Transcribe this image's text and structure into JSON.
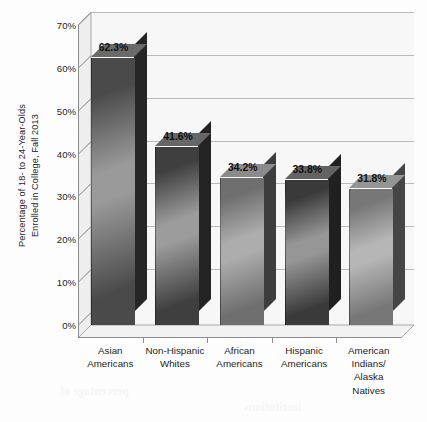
{
  "chart_data": {
    "type": "bar",
    "title": "",
    "subtitle": "",
    "xlabel": "",
    "ylabel": "Percentage of 18- to 24-Year-Olds Enrolled in College, Fall 2013",
    "ylabel_lines": [
      "Percentage of 18- to 24-Year-Olds",
      "Enrolled in College, Fall 2013"
    ],
    "categories": [
      "Asian Americans",
      "Non-Hispanic Whites",
      "African Americans",
      "Hispanic Americans",
      "American Indians/ Alaska Natives"
    ],
    "category_label_lines": [
      [
        "Asian",
        "Americans"
      ],
      [
        "Non-Hispanic",
        "Whites"
      ],
      [
        "African",
        "Americans"
      ],
      [
        "Hispanic",
        "Americans"
      ],
      [
        "American",
        "Indians/",
        "Alaska",
        "Natives"
      ]
    ],
    "values": [
      62.3,
      41.6,
      34.2,
      33.8,
      31.8
    ],
    "value_labels": [
      "62.3%",
      "41.6%",
      "34.2%",
      "33.8%",
      "31.8%"
    ],
    "ylim": [
      0,
      70
    ],
    "ytick_values": [
      0,
      10,
      20,
      30,
      40,
      50,
      60,
      70
    ],
    "ytick_labels": [
      "0%",
      "10%",
      "20%",
      "30%",
      "40%",
      "50%",
      "60%",
      "70%"
    ],
    "grid": true,
    "legend": false,
    "legend_position": "none",
    "three_d": true,
    "colors": {
      "plot_background": "#f7f7f7",
      "page_background": "#fdfdfd",
      "gridline": "#b9b9b9",
      "axis": "#8d8d8d",
      "text": "#1d1d1d",
      "bar_dark": "#3c3c3c",
      "bar_mid": "#8e8e8e",
      "bar_light": "#b4b4b4",
      "bar_side": "#2b2b2b",
      "bar_top": "#6e6e6e"
    },
    "bar_shading": [
      {
        "front_dark": "#4a4a4a",
        "front_light": "#9a9a9a",
        "side": "#262626",
        "top": "#6a6a6a"
      },
      {
        "front_dark": "#3f3f3f",
        "front_light": "#9c9c9c",
        "side": "#232323",
        "top": "#676767"
      },
      {
        "front_dark": "#6f6f6f",
        "front_light": "#adadad",
        "side": "#3d3d3d",
        "top": "#8b8b8b"
      },
      {
        "front_dark": "#3a3a3a",
        "front_light": "#969696",
        "side": "#202020",
        "top": "#636363"
      },
      {
        "front_dark": "#777777",
        "front_light": "#b6b6b6",
        "side": "#454545",
        "top": "#949494"
      }
    ]
  },
  "ghost_text": {
    "lines": [
      {
        "text": "community",
        "x": 210,
        "y": 18,
        "size": 13
      },
      {
        "text": "million",
        "x": 262,
        "y": 46,
        "size": 13
      },
      {
        "text": "enrollment trends",
        "x": 196,
        "y": 86,
        "size": 12
      },
      {
        "text": "students",
        "x": 128,
        "y": 128,
        "size": 12
      },
      {
        "text": "college",
        "x": 296,
        "y": 150,
        "size": 12
      },
      {
        "text": "degree",
        "x": 150,
        "y": 206,
        "size": 12
      },
      {
        "text": "population",
        "x": 250,
        "y": 244,
        "size": 12
      },
      {
        "text": "national",
        "x": 104,
        "y": 286,
        "size": 12
      },
      {
        "text": "education",
        "x": 282,
        "y": 318,
        "size": 12
      },
      {
        "text": "percentage of",
        "x": 60,
        "y": 384,
        "size": 12
      },
      {
        "text": "institutions",
        "x": 244,
        "y": 400,
        "size": 12
      }
    ]
  }
}
